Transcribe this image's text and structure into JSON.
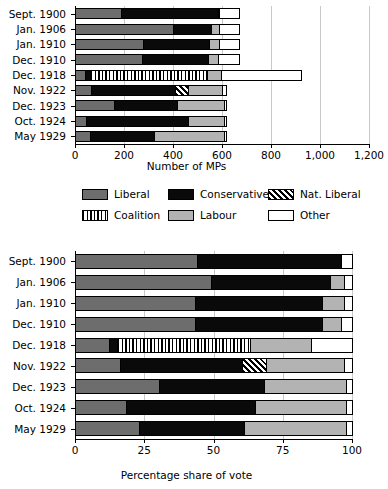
{
  "legend": {
    "items": [
      {
        "label": "Liberal",
        "key": "liberal",
        "color": "#6d6d6d",
        "pattern": "solid"
      },
      {
        "label": "Conservative",
        "key": "conservative",
        "color": "#0a0a0a",
        "pattern": "solid"
      },
      {
        "label": "Nat. Liberal",
        "key": "natliberal",
        "color": "#000000",
        "pattern": "diagonal-hatch"
      },
      {
        "label": "Coalition",
        "key": "coalition",
        "color": "#000000",
        "pattern": "vertical-stripes"
      },
      {
        "label": "Labour",
        "key": "labour",
        "color": "#b3b3b3",
        "pattern": "solid"
      },
      {
        "label": "Other",
        "key": "other",
        "color": "#ffffff",
        "pattern": "solid"
      }
    ]
  },
  "chart_data": [
    {
      "id": "mps",
      "type": "bar",
      "orientation": "horizontal",
      "stacked": true,
      "title": "",
      "xlabel": "Number of MPs",
      "ylabel": "",
      "xlim": [
        0,
        1200
      ],
      "xticks": [
        0,
        200,
        400,
        600,
        800,
        1000,
        1200
      ],
      "xticklabels": [
        "0",
        "200",
        "400",
        "600",
        "800",
        "1,000",
        "1,200"
      ],
      "grid": true,
      "categories": [
        "Sept. 1900",
        "Jan. 1906",
        "Jan. 1910",
        "Dec. 1910",
        "Dec. 1918",
        "Nov. 1922",
        "Dec. 1923",
        "Oct. 1924",
        "May 1929"
      ],
      "series": [
        {
          "name": "Liberal",
          "key": "liberal",
          "values": [
            184,
            400,
            274,
            272,
            36,
            62,
            158,
            40,
            59
          ]
        },
        {
          "name": "Conservative",
          "key": "conservative",
          "values": [
            402,
            156,
            272,
            271,
            23,
            344,
            258,
            419,
            260
          ]
        },
        {
          "name": "Coalition",
          "key": "coalition",
          "values": [
            0,
            0,
            0,
            0,
            478,
            0,
            0,
            0,
            0
          ]
        },
        {
          "name": "Nat. Liberal",
          "key": "natliberal",
          "values": [
            0,
            0,
            0,
            0,
            0,
            53,
            0,
            0,
            0
          ]
        },
        {
          "name": "Labour",
          "key": "labour",
          "values": [
            2,
            30,
            40,
            42,
            57,
            142,
            191,
            151,
            288
          ]
        },
        {
          "name": "Other",
          "key": "other",
          "values": [
            82,
            84,
            84,
            85,
            328,
            14,
            8,
            5,
            8
          ]
        }
      ],
      "totals": [
        670,
        670,
        670,
        670,
        922,
        615,
        615,
        615,
        615
      ]
    },
    {
      "id": "votes",
      "type": "bar",
      "orientation": "horizontal",
      "stacked": true,
      "title": "",
      "xlabel": "Percentage share of vote",
      "ylabel": "",
      "xlim": [
        0,
        100
      ],
      "xticks": [
        0,
        25,
        50,
        75,
        100
      ],
      "xticklabels": [
        "0",
        "25",
        "50",
        "75",
        "100"
      ],
      "grid": true,
      "categories": [
        "Sept. 1900",
        "Jan. 1906",
        "Jan. 1910",
        "Dec. 1910",
        "Dec. 1918",
        "Nov. 1922",
        "Dec. 1923",
        "Oct. 1924",
        "May 1929"
      ],
      "series": [
        {
          "name": "Liberal",
          "key": "liberal",
          "values": [
            44,
            49,
            43,
            43,
            12,
            16,
            30,
            18,
            23
          ]
        },
        {
          "name": "Conservative",
          "key": "conservative",
          "values": [
            52,
            43,
            46,
            46,
            3,
            44,
            38,
            47,
            38
          ]
        },
        {
          "name": "Coalition",
          "key": "coalition",
          "values": [
            0,
            0,
            0,
            0,
            48,
            0,
            0,
            0,
            0
          ]
        },
        {
          "name": "Nat. Liberal",
          "key": "natliberal",
          "values": [
            0,
            0,
            0,
            0,
            0,
            9,
            0,
            0,
            0
          ]
        },
        {
          "name": "Labour",
          "key": "labour",
          "values": [
            0,
            5,
            8,
            7,
            22,
            28,
            30,
            33,
            37
          ]
        },
        {
          "name": "Other",
          "key": "other",
          "values": [
            4,
            3,
            3,
            4,
            15,
            3,
            2,
            2,
            2
          ]
        }
      ],
      "totals": [
        100,
        100,
        100,
        100,
        100,
        100,
        100,
        100,
        100
      ]
    }
  ]
}
